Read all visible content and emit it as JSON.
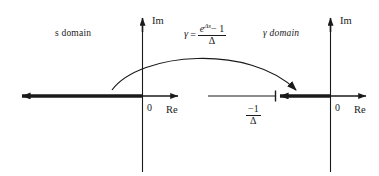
{
  "figure": {
    "background_color": "#ffffff",
    "line_color": "#1a1a1a",
    "text_color": "#1a1a1a"
  },
  "left_plane": {
    "name": "s domain",
    "domain_label": "s domain",
    "imaginary_axis_label": "Im",
    "real_axis_label": "Re",
    "origin_label": "0",
    "highlight": "thick real axis from negative infinity to the origin"
  },
  "right_plane": {
    "name": "gamma domain",
    "domain_label": "γ domain",
    "imaginary_axis_label": "Im",
    "real_axis_label": "Re",
    "origin_label": "0",
    "pole_numerator": "−1",
    "pole_denominator": "Δ",
    "highlight": "thick real axis segment from -1/Δ to the origin"
  },
  "mapping": {
    "lhs": "γ",
    "equals": "=",
    "numerator_base": "e",
    "numerator_exponent": "Δs",
    "numerator_tail": "− 1",
    "denominator": "Δ",
    "arrow": "curved-arrow-left-to-right"
  }
}
